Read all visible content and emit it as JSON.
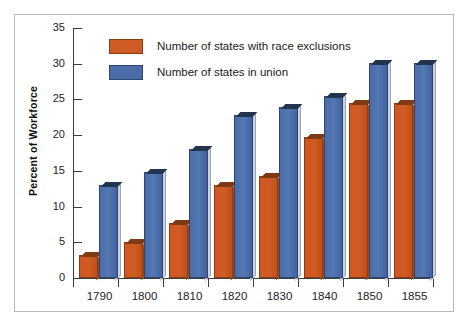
{
  "chart_data": {
    "type": "bar",
    "title": "",
    "xlabel": "",
    "ylabel": "Percent of Workforce",
    "categories": [
      "1790",
      "1800",
      "1810",
      "1820",
      "1830",
      "1840",
      "1850",
      "1855"
    ],
    "ylim": [
      0,
      35
    ],
    "yticks": [
      0,
      5,
      10,
      15,
      20,
      25,
      30,
      35
    ],
    "ytick_labels": [
      "0",
      "5",
      "10",
      "15",
      "20",
      "25",
      "30",
      "35"
    ],
    "grid": false,
    "legend_position": "top-left-inside",
    "series": [
      {
        "name": "Number of states with race exclusions",
        "color": "#cf5c26",
        "values": [
          3.0,
          4.7,
          7.4,
          12.8,
          14.0,
          19.5,
          24.2,
          24.2
        ]
      },
      {
        "name": "Number of states in union",
        "color": "#4b6ca8",
        "values": [
          12.7,
          14.5,
          17.8,
          22.6,
          23.6,
          25.2,
          29.8,
          29.8
        ]
      }
    ]
  },
  "legend": {
    "items": [
      {
        "label": "Number of states with race exclusions",
        "swatch": "orange-swatch"
      },
      {
        "label": "Number of states in union",
        "swatch": "blue-swatch"
      }
    ]
  }
}
